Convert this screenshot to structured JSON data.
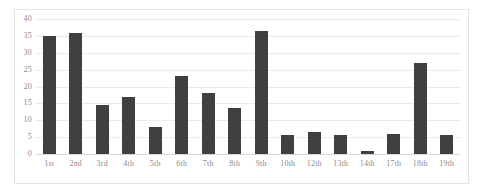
{
  "chart_data": {
    "type": "bar",
    "title": "",
    "xlabel": "",
    "ylabel": "",
    "categories": [
      "1st",
      "2nd",
      "3rd",
      "4th",
      "5th",
      "6th",
      "7th",
      "8th",
      "9th",
      "10th",
      "12th",
      "13th",
      "14th",
      "17th",
      "18th",
      "19th"
    ],
    "values": [
      35,
      36,
      14.5,
      17,
      8,
      23,
      18,
      13.5,
      36.5,
      5.5,
      6.5,
      5.5,
      1,
      6,
      27,
      5.5
    ],
    "ylim": [
      0,
      40
    ],
    "ytick_values": [
      0,
      5,
      10,
      15,
      20,
      25,
      30,
      35,
      40
    ],
    "ytick_labels": [
      "0",
      "5",
      "10",
      "15",
      "20",
      "25",
      "30",
      "35",
      "40"
    ],
    "grid": "horizontal",
    "legend": "none",
    "bar_color": "#404040",
    "gridline_color": "#eaeaea",
    "axis_text_color": "#8a8a8a",
    "border_color": "#e3e3e3",
    "background_color": "#ffffff"
  }
}
